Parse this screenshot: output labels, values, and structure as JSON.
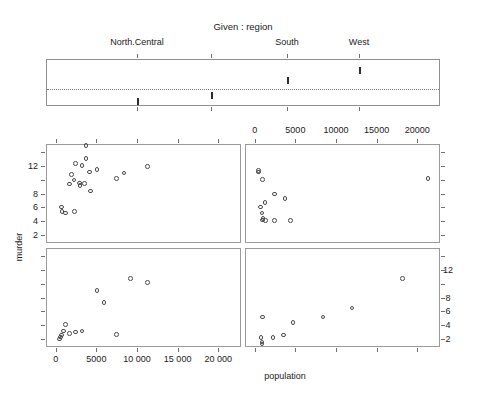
{
  "figure": {
    "given_title": "Given :  region",
    "xlabel": "population",
    "ylabel": "murder"
  },
  "given_panel": {
    "labels": [
      "North.Central",
      "South",
      "West"
    ],
    "label_x": [
      137,
      287,
      359
    ],
    "marks": [
      {
        "x": 137,
        "y": 100,
        "region": "Northeast"
      },
      {
        "x": 211,
        "y": 94,
        "region": "North.Central"
      },
      {
        "x": 287,
        "y": 79,
        "region": "South"
      },
      {
        "x": 359,
        "y": 69,
        "region": "West"
      }
    ],
    "tick_x": [
      137,
      211,
      287,
      359
    ],
    "box": {
      "left": 46,
      "top": 59,
      "width": 394,
      "height": 47
    },
    "dotted_y": 88
  },
  "axes": {
    "x_ticks": [
      0,
      5000,
      10000,
      15000,
      20000
    ],
    "x_tick_labels_top": [
      "0",
      "5000",
      "10000",
      "15000",
      "20000"
    ],
    "x_tick_labels_bottom": [
      "0",
      "5000",
      "10 000",
      "15 000",
      "20 000"
    ],
    "y_ticks": [
      2,
      4,
      6,
      8,
      12
    ],
    "y_tick_labels": [
      "2",
      "4",
      "6",
      "8",
      "12"
    ],
    "xlim": [
      -1200,
      22800
    ],
    "ylim": [
      0.8,
      15.2
    ]
  },
  "chart_data": {
    "type": "scatter",
    "title": "Given :  region",
    "xlabel": "population",
    "ylabel": "murder",
    "conditioning_variable": "region",
    "conditioning_levels": [
      "Northeast",
      "North.Central",
      "South",
      "West"
    ],
    "xlim": [
      -1200,
      22800
    ],
    "ylim": [
      0.8,
      15.2
    ],
    "grid": false,
    "panels": [
      {
        "name": "South",
        "position": "top-left",
        "points": [
          {
            "population": 3615,
            "murder": 15.1
          },
          {
            "population": 2110,
            "murder": 10.1
          },
          {
            "population": 8277,
            "murder": 11.1
          },
          {
            "population": 4931,
            "murder": 11.6
          },
          {
            "population": 637,
            "murder": 5.5
          },
          {
            "population": 3100,
            "murder": 12.2
          },
          {
            "population": 11197,
            "murder": 12.1
          },
          {
            "population": 2861,
            "murder": 9.3
          },
          {
            "population": 3387,
            "murder": 9.6
          },
          {
            "population": 4066,
            "murder": 11.3
          },
          {
            "population": 1058,
            "murder": 5.3
          },
          {
            "population": 2341,
            "murder": 12.5
          },
          {
            "population": 2816,
            "murder": 9.7
          },
          {
            "population": 3624,
            "murder": 13.2
          },
          {
            "population": 1799,
            "murder": 10.9
          },
          {
            "population": 579,
            "murder": 6.2
          },
          {
            "population": 2212,
            "murder": 5.5
          },
          {
            "population": 7333,
            "murder": 10.3
          },
          {
            "population": 4173,
            "murder": 8.5
          },
          {
            "population": 1544,
            "murder": 9.5
          }
        ]
      },
      {
        "name": "West",
        "position": "top-right",
        "points": [
          {
            "population": 365,
            "murder": 11.3
          },
          {
            "population": 332,
            "murder": 11.5
          },
          {
            "population": 813,
            "murder": 10.2
          },
          {
            "population": 2284,
            "murder": 8.1
          },
          {
            "population": 1144,
            "murder": 6.8
          },
          {
            "population": 3615,
            "murder": 7.4
          },
          {
            "population": 590,
            "murder": 6.2
          },
          {
            "population": 746,
            "murder": 5.3
          },
          {
            "population": 868,
            "murder": 4.5
          },
          {
            "population": 812,
            "murder": 4.3
          },
          {
            "population": 1203,
            "murder": 4.2
          },
          {
            "population": 2284,
            "murder": 4.2
          },
          {
            "population": 4281,
            "murder": 4.2
          },
          {
            "population": 21198,
            "murder": 10.3
          }
        ]
      },
      {
        "name": "Northeast",
        "position": "bottom-left",
        "points": [
          {
            "population": 365,
            "murder": 2.1
          },
          {
            "population": 472,
            "murder": 2.4
          },
          {
            "population": 579,
            "murder": 2.7
          },
          {
            "population": 812,
            "murder": 3.3
          },
          {
            "population": 1058,
            "murder": 4.2
          },
          {
            "population": 1544,
            "murder": 2.9
          },
          {
            "population": 2341,
            "murder": 3.1
          },
          {
            "population": 3100,
            "murder": 3.3
          },
          {
            "population": 4931,
            "murder": 9.2
          },
          {
            "population": 5814,
            "murder": 7.4
          },
          {
            "population": 9111,
            "murder": 10.9
          },
          {
            "population": 11197,
            "murder": 10.3
          },
          {
            "population": 7333,
            "murder": 2.8
          }
        ]
      },
      {
        "name": "North.Central",
        "position": "bottom-right",
        "points": [
          {
            "population": 637,
            "murder": 2.3
          },
          {
            "population": 746,
            "murder": 1.4
          },
          {
            "population": 746,
            "murder": 1.7
          },
          {
            "population": 812,
            "murder": 5.3
          },
          {
            "population": 2110,
            "murder": 2.3
          },
          {
            "population": 3387,
            "murder": 2.7
          },
          {
            "population": 4589,
            "murder": 4.5
          },
          {
            "population": 8277,
            "murder": 5.3
          },
          {
            "population": 11860,
            "murder": 6.6
          },
          {
            "population": 18076,
            "murder": 10.9
          }
        ]
      }
    ]
  }
}
